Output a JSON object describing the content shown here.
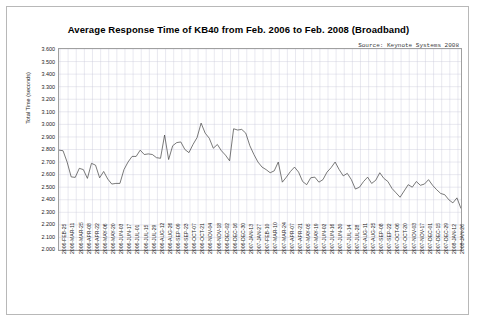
{
  "chart_data": {
    "type": "line",
    "title": "Average Response Time of KB40 from Feb. 2006 to Feb. 2008 (Broadband)",
    "source": "Source: Keynote Systems 2008",
    "xlabel": "",
    "ylabel": "Total Time (seconds)",
    "ylim": [
      2.0,
      3.6
    ],
    "ytick_step": 0.1,
    "grid": true,
    "legend": "none",
    "line_color": "#404040",
    "grid_color": "#c8c8d8",
    "ytick_labels": [
      "3.600",
      "3.500",
      "3.400",
      "3.300",
      "3.200",
      "3.100",
      "3.000",
      "2.900",
      "2.800",
      "2.700",
      "2.600",
      "2.500",
      "2.400",
      "2.300",
      "2.200",
      "2.100",
      "2.000"
    ],
    "xtick_labels": [
      "2006-FEB-25",
      "2006-MAR-11",
      "2006-MAR-25",
      "2006-APR-08",
      "2006-APR-22",
      "2006-MAY-06",
      "2006-MAY-20",
      "2006-JUN-03",
      "2006-JUN-17",
      "2006-JUL-01",
      "2006-JUL-15",
      "2006-JUL-29",
      "2006-AUG-12",
      "2006-AUG-26",
      "2006-SEP-09",
      "2006-SEP-23",
      "2006-OCT-07",
      "2006-OCT-21",
      "2006-NOV-04",
      "2006-NOV-18",
      "2006-DEC-02",
      "2006-DEC-16",
      "2006-DEC-30",
      "2007-JAN-13",
      "2007-JAN-27",
      "2007-FEB-10",
      "2007-MAR-10",
      "2007-MAR-24",
      "2007-APR-07",
      "2007-APR-21",
      "2007-MAY-05",
      "2007-MAY-19",
      "2007-JUN-02",
      "2007-JUN-16",
      "2007-JUN-30",
      "2007-JUL-14",
      "2007-JUL-28",
      "2007-AUG-11",
      "2007-AUG-25",
      "2007-SEP-08",
      "2007-SEP-22",
      "2007-OCT-06",
      "2007-OCT-20",
      "2007-NOV-03",
      "2007-NOV-17",
      "2007-DEC-01",
      "2007-DEC-15",
      "2007-DEC-29",
      "2008-JAN-12",
      "2008-JAN-26"
    ],
    "values": [
      2.795,
      2.79,
      2.7,
      2.582,
      2.578,
      2.65,
      2.64,
      2.57,
      2.69,
      2.675,
      2.575,
      2.625,
      2.565,
      2.525,
      2.53,
      2.53,
      2.64,
      2.7,
      2.745,
      2.745,
      2.795,
      2.76,
      2.765,
      2.76,
      2.735,
      2.73,
      2.915,
      2.72,
      2.83,
      2.855,
      2.86,
      2.8,
      2.775,
      2.84,
      2.895,
      3.01,
      2.93,
      2.89,
      2.81,
      2.84,
      2.79,
      2.755,
      2.71,
      2.965,
      2.955,
      2.96,
      2.93,
      2.83,
      2.76,
      2.7,
      2.66,
      2.64,
      2.615,
      2.63,
      2.7,
      2.54,
      2.58,
      2.625,
      2.66,
      2.62,
      2.545,
      2.52,
      2.575,
      2.58,
      2.54,
      2.56,
      2.62,
      2.655,
      2.7,
      2.64,
      2.59,
      2.61,
      2.56,
      2.485,
      2.5,
      2.545,
      2.58,
      2.53,
      2.555,
      2.615,
      2.57,
      2.545,
      2.49,
      2.455,
      2.42,
      2.47,
      2.52,
      2.5,
      2.545,
      2.515,
      2.525,
      2.56,
      2.515,
      2.48,
      2.45,
      2.44,
      2.4,
      2.375,
      2.415,
      2.33
    ]
  }
}
